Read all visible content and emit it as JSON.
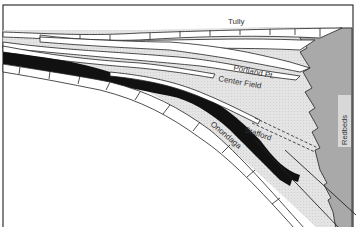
{
  "diagram": {
    "type": "stratigraphic cross-section",
    "labels": {
      "tully": "Tully",
      "portland_pt": "Portland Pt.",
      "center_field": "Center Field",
      "stafford": "Stafford",
      "onondaga": "Onondaga",
      "redbeds": "Redbeds"
    },
    "colors": {
      "shale_fill": "#e2e2e2",
      "black_shale": "#111111",
      "limestone": "#ffffff",
      "redbeds_fill": "#a8a8a8",
      "outline": "#222222"
    }
  }
}
